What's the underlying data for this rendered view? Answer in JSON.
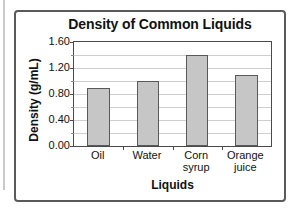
{
  "chart_data": {
    "type": "bar",
    "title": "Density of Common Liquids",
    "xlabel": "Liquids",
    "ylabel": "Density (g/mL)",
    "categories": [
      "Oil",
      "Water",
      "Corn syrup",
      "Orange juice"
    ],
    "category_lines": [
      [
        "Oil"
      ],
      [
        "Water"
      ],
      [
        "Corn",
        "syrup"
      ],
      [
        "Orange",
        "juice"
      ]
    ],
    "values": [
      0.9,
      1.0,
      1.4,
      1.1
    ],
    "ylim": [
      0.0,
      1.6
    ],
    "ytick_labels": [
      "0.00",
      "0.40",
      "0.80",
      "1.20",
      "1.60"
    ],
    "ytick_values": [
      0.0,
      0.4,
      0.8,
      1.2,
      1.6
    ],
    "gridline_values": [
      0.2,
      0.4,
      0.6,
      0.8,
      1.0,
      1.2,
      1.4
    ],
    "grid": true,
    "legend": "none",
    "bar_fill_color": "#c6c6c6",
    "bar_border_color": "#595959",
    "gridline_color": "#cfcfcf",
    "axis_color": "#4a4a4a",
    "frame_color": "#5a5a5a",
    "text_color": "#111111"
  }
}
